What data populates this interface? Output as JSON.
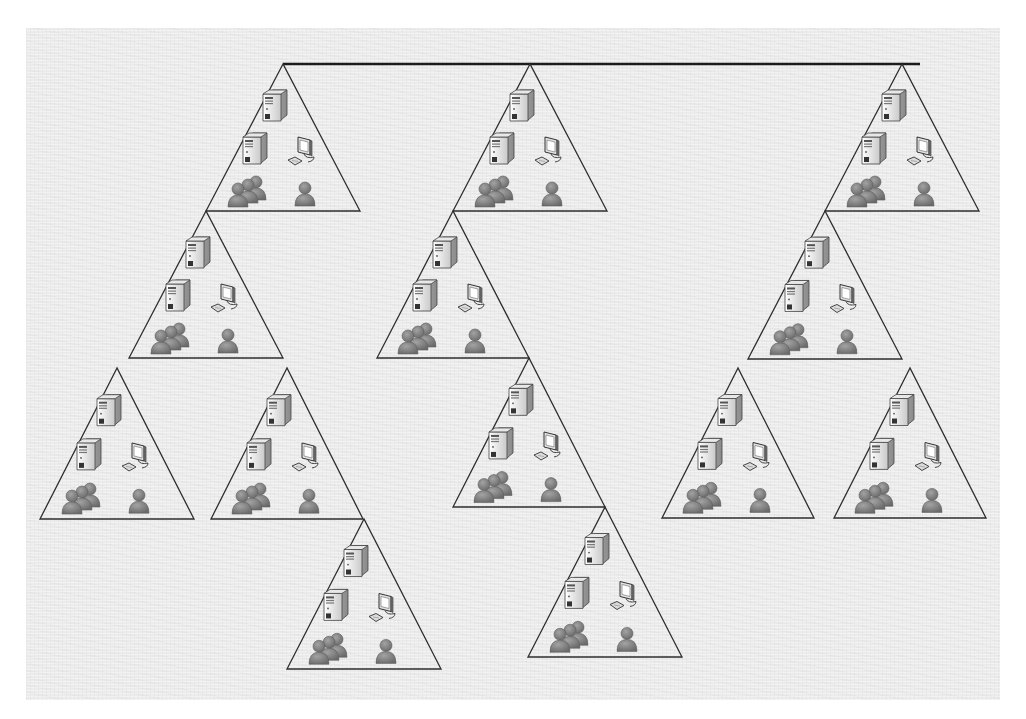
{
  "diagram": {
    "title": "",
    "colors": {
      "background": "#ececec",
      "line": "#2e2e2e",
      "bus": "#1c1c1c",
      "server_body": "#f2f2f2",
      "server_shade": "#b8b8b8",
      "user": "#7d7d7d"
    },
    "bus": {
      "x1": 283,
      "x2": 920,
      "y": 64
    },
    "node_contents": [
      "server",
      "server",
      "workstation",
      "user-group",
      "user"
    ],
    "nodes": [
      {
        "id": "t1",
        "apex": [
          283,
          64
        ],
        "half_width": 77,
        "height": 147,
        "parent": "bus"
      },
      {
        "id": "t2",
        "apex": [
          206,
          211
        ],
        "half_width": 77,
        "height": 147,
        "parent": "t1"
      },
      {
        "id": "t3",
        "apex": [
          117,
          368
        ],
        "half_width": 77,
        "height": 151,
        "parent": "t2"
      },
      {
        "id": "t4",
        "apex": [
          287,
          368
        ],
        "half_width": 76,
        "height": 151,
        "parent": "t2"
      },
      {
        "id": "t5",
        "apex": [
          364,
          519
        ],
        "half_width": 77,
        "height": 150,
        "parent": "t4"
      },
      {
        "id": "t6",
        "apex": [
          530,
          64
        ],
        "half_width": 77,
        "height": 147,
        "parent": "bus"
      },
      {
        "id": "t7",
        "apex": [
          453,
          211
        ],
        "half_width": 76,
        "height": 147,
        "parent": "t6"
      },
      {
        "id": "t8",
        "apex": [
          529,
          358
        ],
        "half_width": 76,
        "height": 149,
        "parent": "t7"
      },
      {
        "id": "t9",
        "apex": [
          605,
          507
        ],
        "half_width": 77,
        "height": 150,
        "parent": "t8"
      },
      {
        "id": "t10",
        "apex": [
          902,
          64
        ],
        "half_width": 77,
        "height": 147,
        "parent": "bus"
      },
      {
        "id": "t11",
        "apex": [
          825,
          211
        ],
        "half_width": 77,
        "height": 148,
        "parent": "t10"
      },
      {
        "id": "t12",
        "apex": [
          738,
          368
        ],
        "half_width": 76,
        "height": 150,
        "parent": "t11"
      },
      {
        "id": "t13",
        "apex": [
          910,
          368
        ],
        "half_width": 76,
        "height": 150,
        "parent": "t11"
      }
    ]
  }
}
